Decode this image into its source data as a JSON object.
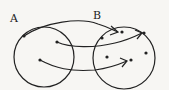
{
  "diagram": {
    "type": "set-mapping",
    "sets": [
      {
        "id": "A",
        "label": "A",
        "elements": [
          "a1",
          "a2",
          "a3"
        ]
      },
      {
        "id": "B",
        "label": "B",
        "elements": [
          "b1",
          "b2",
          "b3",
          "b4",
          "b5",
          "b6"
        ]
      }
    ],
    "mappings": [
      {
        "from": "a1",
        "to": "b1"
      },
      {
        "from": "a2",
        "to": "b3"
      },
      {
        "from": "a3",
        "to": "b5"
      }
    ],
    "colors": {
      "stroke": "#222222",
      "background": "#f7f6f3"
    }
  }
}
